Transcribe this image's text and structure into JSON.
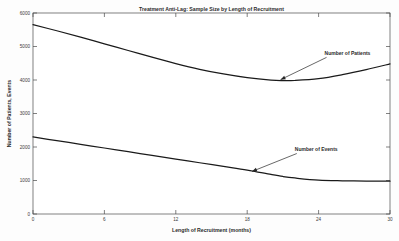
{
  "chart_data": {
    "type": "line",
    "title": "Treatment Anti-Lag: Sample Size by Length of Recruitment",
    "xlabel": "Length of Recruitment (months)",
    "ylabel": "Number of Patients, Events",
    "xlim": [
      0,
      30
    ],
    "ylim": [
      0,
      6000
    ],
    "xticks": [
      0,
      6,
      12,
      18,
      24,
      30
    ],
    "xticklabels": [
      "0",
      "6",
      "12",
      "18",
      "24",
      "30"
    ],
    "yticks": [
      0,
      1000,
      2000,
      3000,
      4000,
      5000,
      6000
    ],
    "yticklabels": [
      "0",
      "1000",
      "2000",
      "3000",
      "4000",
      "5000",
      "6000"
    ],
    "grid": false,
    "legend": "none",
    "line_color": "#1a1a1a",
    "x": [
      0,
      2,
      4,
      6,
      8,
      10,
      12,
      14,
      16,
      18,
      20,
      21,
      22,
      24,
      26,
      28,
      30
    ],
    "series": [
      {
        "name": "Number of Patients",
        "values": [
          5650,
          5470,
          5280,
          5080,
          4880,
          4680,
          4490,
          4320,
          4180,
          4070,
          3995,
          3980,
          3985,
          4040,
          4160,
          4310,
          4480
        ]
      },
      {
        "name": "Number of Events",
        "values": [
          2300,
          2190,
          2080,
          1970,
          1860,
          1750,
          1640,
          1530,
          1420,
          1310,
          1180,
          1120,
          1075,
          1010,
          990,
          982,
          978
        ]
      }
    ],
    "annotations": [
      {
        "label": "Number of Patients",
        "text_x": 24.5,
        "text_y": 4750,
        "point_x": 20.8,
        "point_y": 4010
      },
      {
        "label": "Number of Events",
        "text_x": 22.0,
        "text_y": 1880,
        "point_x": 18.4,
        "point_y": 1270
      }
    ]
  }
}
